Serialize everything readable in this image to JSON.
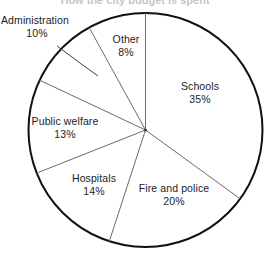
{
  "chart_data": {
    "type": "pie",
    "title": "How the city budget is spent",
    "title_visible": false,
    "categories": [
      "Schools",
      "Fire and police",
      "Hospitals",
      "Public welfare",
      "Administration",
      "Other"
    ],
    "values": [
      35,
      20,
      14,
      13,
      10,
      8
    ],
    "value_suffix": "%",
    "total": 100,
    "start_angle_deg": 0,
    "direction": "clockwise",
    "legend": "none",
    "grid": false,
    "xlabel": "",
    "ylabel": "",
    "slices": [
      {
        "label": "Schools",
        "value": 35,
        "percent_text": "35%",
        "label_placement": "inside"
      },
      {
        "label": "Fire and police",
        "value": 20,
        "percent_text": "20%",
        "label_placement": "inside"
      },
      {
        "label": "Hospitals",
        "value": 14,
        "percent_text": "14%",
        "label_placement": "inside"
      },
      {
        "label": "Public welfare",
        "value": 13,
        "percent_text": "13%",
        "label_placement": "inside"
      },
      {
        "label": "Administration",
        "value": 10,
        "percent_text": "10%",
        "label_placement": "outside-leader"
      },
      {
        "label": "Other",
        "value": 8,
        "percent_text": "8%",
        "label_placement": "inside"
      }
    ]
  },
  "style": {
    "background": "#ffffff",
    "outline_color": "#111111",
    "divider_color": "#6b6b6b",
    "leader_color": "#4d4d4d",
    "text_color": "#1d1d1d"
  },
  "geometry": {
    "center_x": 145.5,
    "center_y": 130,
    "radius": 117
  }
}
